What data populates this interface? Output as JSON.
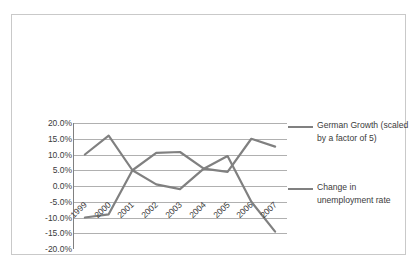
{
  "chart_data": {
    "type": "line",
    "title": "",
    "subtitle": "",
    "xlabel": "",
    "ylabel": "",
    "categories": [
      "1999",
      "2000",
      "2001",
      "2002",
      "2003",
      "2004",
      "2005",
      "2006",
      "2007"
    ],
    "series": [
      {
        "name": "German Growth  (scaled by a factor of 5)",
        "color": "#808080",
        "values": [
          10.0,
          16.0,
          5.0,
          0.5,
          -1.0,
          5.5,
          4.5,
          15.0,
          12.5
        ]
      },
      {
        "name": "Change in unemployment rate",
        "color": "#808080",
        "values": [
          -10.0,
          -9.0,
          5.0,
          10.5,
          10.8,
          5.5,
          9.5,
          -5.0,
          -14.5
        ]
      }
    ],
    "ylim": [
      -20.0,
      20.0
    ],
    "ytick_values": [
      20.0,
      15.0,
      10.0,
      5.0,
      0.0,
      -5.0,
      -10.0,
      -15.0,
      -20.0
    ],
    "ytick_labels": [
      "20.0%",
      "15.0%",
      "10.0%",
      "5.0%",
      "0.0%",
      "-5.0%",
      "-10.0%",
      "-15.0%",
      "-20.0%"
    ],
    "grid": true,
    "grid_color": "#b0b0b0",
    "axis_color": "#808080",
    "legend_position": "right",
    "legend": [
      {
        "label": "German Growth  (scaled\nby a factor of 5)",
        "color": "#808080"
      },
      {
        "label": "Change in\nunemployment rate",
        "color": "#808080"
      }
    ],
    "frame_color": "#c9c9c9",
    "background_color": "#ffffff"
  }
}
